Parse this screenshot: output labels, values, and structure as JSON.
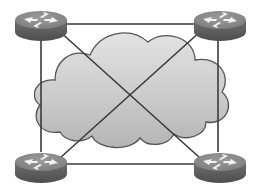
{
  "diagram": {
    "type": "network-topology",
    "colors": {
      "background": "#ffffff",
      "cloud_fill": "#c8c8c8",
      "cloud_stroke": "#555555",
      "router_top": "#8a8a8a",
      "router_side": "#5e5e5e",
      "link": "#3a3a3a",
      "arrow": "#f2f2f2"
    },
    "nodes": [
      {
        "id": "router-top-left",
        "type": "router",
        "cx": 41,
        "cy": 20
      },
      {
        "id": "router-top-right",
        "type": "router",
        "cx": 220,
        "cy": 20
      },
      {
        "id": "router-bottom-left",
        "type": "router",
        "cx": 41,
        "cy": 162
      },
      {
        "id": "router-bottom-right",
        "type": "router",
        "cx": 220,
        "cy": 162
      }
    ],
    "links": [
      {
        "from": "router-top-left",
        "to": "router-top-right"
      },
      {
        "from": "router-bottom-left",
        "to": "router-bottom-right"
      },
      {
        "from": "router-top-left",
        "to": "router-bottom-left"
      },
      {
        "from": "router-top-right",
        "to": "router-bottom-right"
      },
      {
        "from": "router-top-left",
        "to": "router-bottom-right"
      },
      {
        "from": "router-top-right",
        "to": "router-bottom-left"
      }
    ],
    "cloud": {
      "label": ""
    }
  }
}
